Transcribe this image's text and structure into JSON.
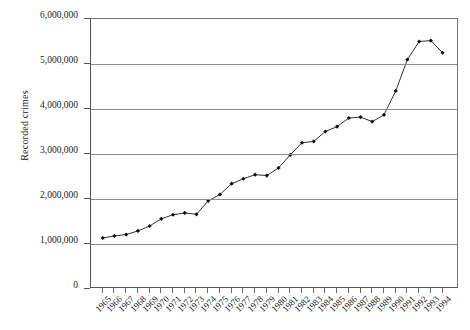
{
  "chart_data": {
    "type": "line",
    "title": "",
    "xlabel": "",
    "ylabel": "Recorded crimes",
    "ylim": [
      0,
      6000000
    ],
    "ytick_labels": [
      "6,000,000",
      "5,000,000",
      "4,000,000",
      "3,000,000",
      "2,000,000",
      "1,000,000",
      "0"
    ],
    "ytick_values": [
      6000000,
      5000000,
      4000000,
      3000000,
      2000000,
      1000000,
      0
    ],
    "grid": true,
    "legend": "none",
    "marker": "filled-diamond",
    "categories": [
      "1965",
      "1966",
      "1967",
      "1968",
      "1969",
      "1970",
      "1971",
      "1972",
      "1973",
      "1974",
      "1975",
      "1976",
      "1977",
      "1978",
      "1979",
      "1980",
      "1981",
      "1982",
      "1983",
      "1984",
      "1985",
      "1986",
      "1987",
      "1988",
      "1989",
      "1990",
      "1991",
      "1992",
      "1993",
      "1994"
    ],
    "values": [
      1134000,
      1180000,
      1210000,
      1290000,
      1400000,
      1560000,
      1650000,
      1690000,
      1660000,
      1960000,
      2100000,
      2340000,
      2450000,
      2540000,
      2520000,
      2690000,
      2980000,
      3250000,
      3280000,
      3500000,
      3610000,
      3800000,
      3820000,
      3720000,
      3870000,
      4400000,
      5100000,
      5500000,
      5520000,
      5250000
    ],
    "series_name": "Recorded crimes"
  },
  "axis": {
    "y_title": "Recorded crimes"
  }
}
